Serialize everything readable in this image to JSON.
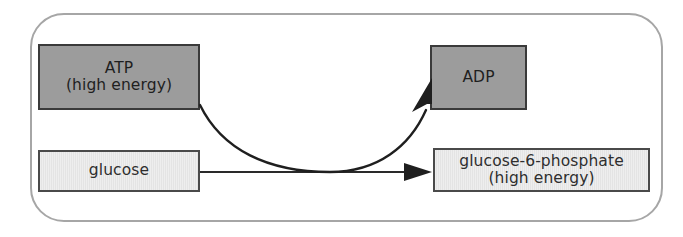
{
  "diagram": {
    "frame": {
      "name": "rounded-container",
      "border_color": "#a6a6a6"
    },
    "nodes": [
      {
        "id": "atp",
        "name": "ATP",
        "lines": [
          "ATP",
          "(high energy)"
        ],
        "style": "dark",
        "fill": "#9c9c9c",
        "border": "#3a3a3a"
      },
      {
        "id": "adp",
        "name": "ADP",
        "lines": [
          "ADP"
        ],
        "style": "dark",
        "fill": "#9c9c9c",
        "border": "#3a3a3a"
      },
      {
        "id": "glucose",
        "name": "glucose",
        "lines": [
          "glucose"
        ],
        "style": "light",
        "fill": "#eaeaea",
        "border": "#4a4a4a"
      },
      {
        "id": "g6p",
        "name": "glucose-6-phosphate",
        "lines": [
          "glucose-6-phosphate",
          "(high energy)"
        ],
        "style": "light",
        "fill": "#eaeaea",
        "border": "#4a4a4a"
      }
    ],
    "arrows": [
      {
        "id": "main-reaction",
        "label": "glucose to glucose-6-phosphate",
        "from": "glucose",
        "to": "g6p",
        "shape": "straight",
        "color": "#2a2a2a"
      },
      {
        "id": "cofactor-conversion",
        "label": "ATP to ADP",
        "from": "atp",
        "to": "adp",
        "shape": "curved",
        "color": "#1f1f1f"
      }
    ]
  }
}
